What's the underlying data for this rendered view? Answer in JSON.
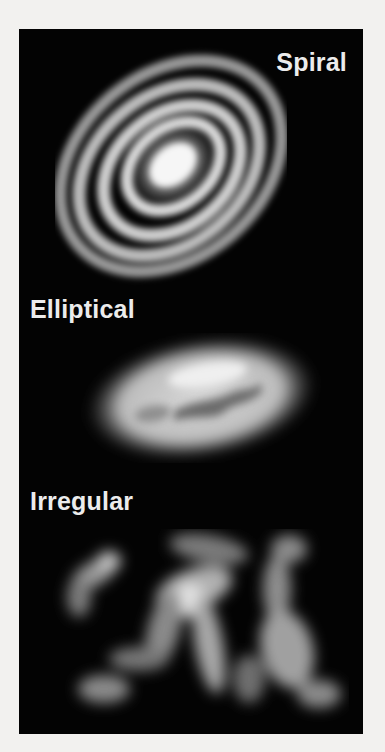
{
  "figure": {
    "background_color": "#030303",
    "page_color": "#f2f1ef",
    "label_color": "#ececec",
    "panels": [
      {
        "label": "Spiral",
        "type": "spiral-galaxy"
      },
      {
        "label": "Elliptical",
        "type": "elliptical-galaxy"
      },
      {
        "label": "Irregular",
        "type": "irregular-galaxy"
      }
    ]
  }
}
